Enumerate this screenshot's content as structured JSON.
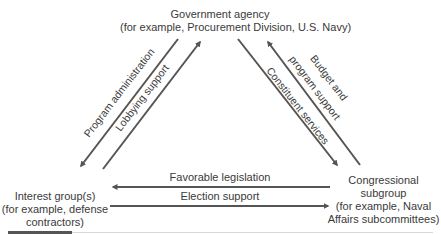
{
  "nodes": {
    "agency": {
      "title": "Government agency",
      "example": "(for example, Procurement Division, U.S. Navy)"
    },
    "interest_group": {
      "line1": "Interest group(s)",
      "line2": "(for example, defense",
      "line3": "contractors)"
    },
    "congress": {
      "line1": "Congressional",
      "line2": "subgroup",
      "line3": "(for example, Naval",
      "line4": "Affairs subcommittees)"
    }
  },
  "edges": {
    "program_administration": {
      "label": "Program administration",
      "from": "Government agency",
      "to": "Interest group(s)"
    },
    "lobbying_support": {
      "label": "Lobbying support",
      "from": "Interest group(s)",
      "to": "Government agency"
    },
    "constituent_services": {
      "label": "Constituent services",
      "from": "Government agency",
      "to": "Congressional subgroup"
    },
    "budget_support": {
      "label_line1": "Budget and",
      "label_line2": "program support",
      "from": "Congressional subgroup",
      "to": "Government agency"
    },
    "favorable_legislation": {
      "label": "Favorable legislation",
      "from": "Congressional subgroup",
      "to": "Interest group(s)"
    },
    "election_support": {
      "label": "Election support",
      "from": "Interest group(s)",
      "to": "Congressional subgroup"
    }
  },
  "colors": {
    "arrow": "#555555",
    "text": "#3a3a3a"
  }
}
